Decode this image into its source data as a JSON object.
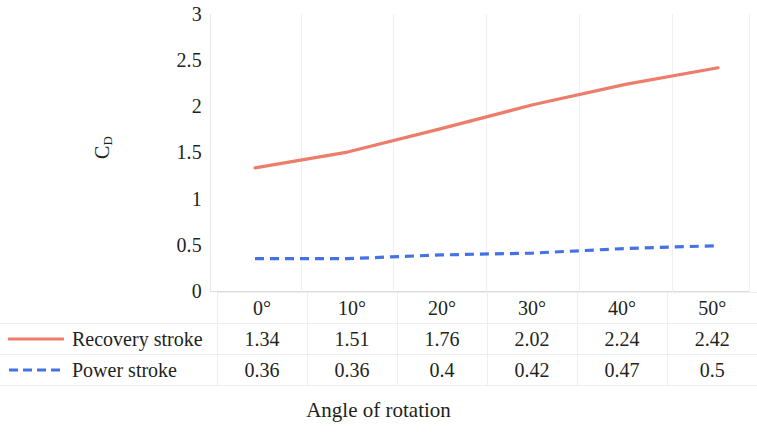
{
  "chart_data": {
    "type": "line",
    "title": "",
    "xlabel": "Angle of rotation",
    "ylabel": "C_D",
    "ylabel_base": "C",
    "ylabel_sub": "D",
    "categories": [
      "0°",
      "10°",
      "20°",
      "30°",
      "40°",
      "50°"
    ],
    "ylim": [
      0,
      3
    ],
    "yticks": [
      "3",
      "2.5",
      "2",
      "1.5",
      "1",
      "0.5",
      "0"
    ],
    "ytick_values": [
      3,
      2.5,
      2,
      1.5,
      1,
      0.5,
      0
    ],
    "grid": "vertical-only",
    "legend_position": "data-table-row-headers",
    "series": [
      {
        "name": "Recovery stroke",
        "color": "#ED7D6B",
        "style": "solid",
        "values": [
          1.34,
          1.51,
          1.76,
          2.02,
          2.24,
          2.42
        ],
        "labels": [
          "1.34",
          "1.51",
          "1.76",
          "2.02",
          "2.24",
          "2.42"
        ]
      },
      {
        "name": "Power stroke",
        "color": "#4472E4",
        "style": "dashed",
        "values": [
          0.36,
          0.36,
          0.4,
          0.42,
          0.47,
          0.5
        ],
        "labels": [
          "0.36",
          "0.36",
          "0.4",
          "0.42",
          "0.47",
          "0.5"
        ]
      }
    ]
  },
  "table": {
    "header_blank": "",
    "category_row": [
      "0°",
      "10°",
      "20°",
      "30°",
      "40°",
      "50°"
    ],
    "rows": [
      {
        "label": "Recovery stroke",
        "values": [
          "1.34",
          "1.51",
          "1.76",
          "2.02",
          "2.24",
          "2.42"
        ]
      },
      {
        "label": "Power stroke",
        "values": [
          "0.36",
          "0.36",
          "0.4",
          "0.42",
          "0.47",
          "0.5"
        ]
      }
    ]
  },
  "axes": {
    "x_title": "Angle of rotation",
    "y_title_base": "C",
    "y_title_sub": "D"
  },
  "colors": {
    "recovery": "#ED7D6B",
    "power": "#4472E4",
    "gridline": "#f0f0f2",
    "table_border": "#eeeef0",
    "text": "#231f20"
  }
}
